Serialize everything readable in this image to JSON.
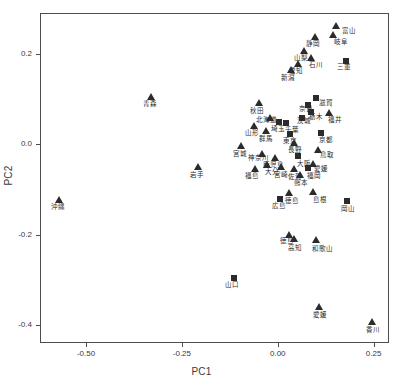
{
  "chart_data": {
    "type": "scatter",
    "title": "",
    "xlabel": "PC1",
    "ylabel": "PC2",
    "xlim": [
      -0.62,
      0.29
    ],
    "ylim": [
      -0.44,
      0.29
    ],
    "xticks": [
      -0.5,
      -0.25,
      0.0,
      0.25
    ],
    "xticklabels": [
      "-0.50",
      "-0.25",
      "0.00",
      "0.25"
    ],
    "yticks": [
      0.2,
      0.0,
      -0.2,
      -0.4
    ],
    "yticklabels": [
      "0.2",
      "0.0",
      "-0.2",
      "-0.4"
    ],
    "grid": false,
    "legend": "none",
    "marker_shapes": [
      "triangle",
      "square"
    ],
    "marker_color": "#2b2b2b",
    "points": [
      {
        "label": "富山",
        "x": 0.152,
        "y": 0.262,
        "marker": "triangle",
        "lx": 6,
        "ly": 2
      },
      {
        "label": "岐阜",
        "x": 0.143,
        "y": 0.242,
        "marker": "triangle",
        "lx": 1,
        "ly": 4
      },
      {
        "label": "静岡",
        "x": 0.096,
        "y": 0.237,
        "marker": "triangle",
        "lx": -9,
        "ly": 4
      },
      {
        "label": "山梨",
        "x": 0.069,
        "y": 0.205,
        "marker": "triangle",
        "lx": -10,
        "ly": 4
      },
      {
        "label": "石川",
        "x": 0.086,
        "y": 0.191,
        "marker": "triangle",
        "lx": -2,
        "ly": 4
      },
      {
        "label": "三重",
        "x": 0.178,
        "y": 0.184,
        "marker": "square",
        "lx": -9,
        "ly": 3
      },
      {
        "label": "愛知",
        "x": 0.054,
        "y": 0.178,
        "marker": "triangle",
        "lx": -9,
        "ly": 4
      },
      {
        "label": "新潟",
        "x": 0.035,
        "y": 0.163,
        "marker": "triangle",
        "lx": -10,
        "ly": 5
      },
      {
        "label": "青森",
        "x": -0.33,
        "y": 0.104,
        "marker": "triangle",
        "lx": -8,
        "ly": 4
      },
      {
        "label": "滋賀",
        "x": 0.1,
        "y": 0.103,
        "marker": "square",
        "lx": 3,
        "ly": 2
      },
      {
        "label": "秋田",
        "x": -0.048,
        "y": 0.09,
        "marker": "triangle",
        "lx": -9,
        "ly": 5
      },
      {
        "label": "奈良",
        "x": 0.079,
        "y": 0.086,
        "marker": "square",
        "lx": -9,
        "ly": 1
      },
      {
        "label": "栃木",
        "x": 0.087,
        "y": 0.07,
        "marker": "square",
        "lx": -2,
        "ly": 2
      },
      {
        "label": "福井",
        "x": 0.133,
        "y": 0.068,
        "marker": "triangle",
        "lx": -1,
        "ly": 4
      },
      {
        "label": "北海道",
        "x": -0.02,
        "y": 0.058,
        "marker": "triangle",
        "lx": -14,
        "ly": -1
      },
      {
        "label": "茨城",
        "x": 0.062,
        "y": 0.058,
        "marker": "square",
        "lx": -5,
        "ly": 0
      },
      {
        "label": "埼玉",
        "x": 0.003,
        "y": 0.048,
        "marker": "square",
        "lx": -8,
        "ly": 4
      },
      {
        "label": "千葉",
        "x": 0.022,
        "y": 0.046,
        "marker": "square",
        "lx": -1,
        "ly": 4
      },
      {
        "label": "山形",
        "x": -0.063,
        "y": 0.039,
        "marker": "triangle",
        "lx": -9,
        "ly": 4
      },
      {
        "label": "群馬",
        "x": -0.03,
        "y": 0.03,
        "marker": "triangle",
        "lx": -7,
        "ly": 5
      },
      {
        "label": "京都",
        "x": 0.113,
        "y": 0.024,
        "marker": "square",
        "lx": -2,
        "ly": 4
      },
      {
        "label": "東京",
        "x": 0.032,
        "y": 0.022,
        "marker": "square",
        "lx": -7,
        "ly": 4
      },
      {
        "label": "長野",
        "x": 0.041,
        "y": 0.003,
        "marker": "triangle",
        "lx": -6,
        "ly": 4
      },
      {
        "label": "宮城",
        "x": -0.097,
        "y": -0.005,
        "marker": "triangle",
        "lx": -8,
        "ly": 5
      },
      {
        "label": "鳥取",
        "x": 0.104,
        "y": -0.014,
        "marker": "triangle",
        "lx": 2,
        "ly": 2
      },
      {
        "label": "神奈川",
        "x": -0.041,
        "y": -0.022,
        "marker": "triangle",
        "lx": -14,
        "ly": 1
      },
      {
        "label": "鹿児島",
        "x": -0.008,
        "y": -0.031,
        "marker": "triangle",
        "lx": -12,
        "ly": 4
      },
      {
        "label": "大阪",
        "x": 0.053,
        "y": -0.027,
        "marker": "square",
        "lx": -1,
        "ly": 5
      },
      {
        "label": "大分",
        "x": -0.028,
        "y": -0.046,
        "marker": "triangle",
        "lx": -2,
        "ly": 4
      },
      {
        "label": "岩手",
        "x": -0.207,
        "y": -0.05,
        "marker": "triangle",
        "lx": -8,
        "ly": 5
      },
      {
        "label": "福島",
        "x": -0.059,
        "y": -0.055,
        "marker": "triangle",
        "lx": -10,
        "ly": 4
      },
      {
        "label": "宮崎",
        "x": 0.008,
        "y": -0.05,
        "marker": "triangle",
        "lx": -7,
        "ly": 5
      },
      {
        "label": "佐賀",
        "x": 0.042,
        "y": -0.055,
        "marker": "triangle",
        "lx": -6,
        "ly": 5
      },
      {
        "label": "福岡",
        "x": 0.08,
        "y": -0.053,
        "marker": "square",
        "lx": -1,
        "ly": 5
      },
      {
        "label": "愛媛",
        "x": 0.091,
        "y": -0.045,
        "marker": "triangle",
        "lx": 1,
        "ly": 2
      },
      {
        "label": "熊本",
        "x": 0.059,
        "y": -0.069,
        "marker": "triangle",
        "lx": -6,
        "ly": 5
      },
      {
        "label": "徳島",
        "x": 0.028,
        "y": -0.108,
        "marker": "triangle",
        "lx": -4,
        "ly": 5
      },
      {
        "label": "島根",
        "x": 0.092,
        "y": -0.105,
        "marker": "triangle",
        "lx": 0,
        "ly": 5
      },
      {
        "label": "広島",
        "x": 0.006,
        "y": -0.122,
        "marker": "square",
        "lx": -8,
        "ly": 4
      },
      {
        "label": "岡山",
        "x": 0.18,
        "y": -0.125,
        "marker": "square",
        "lx": -6,
        "ly": 5
      },
      {
        "label": "沖縄",
        "x": -0.57,
        "y": -0.123,
        "marker": "triangle",
        "lx": -8,
        "ly": 4
      },
      {
        "label": "徳島",
        "x": 0.03,
        "y": -0.202,
        "marker": "triangle",
        "lx": -9,
        "ly": 3
      },
      {
        "label": "高知",
        "x": 0.043,
        "y": -0.21,
        "marker": "triangle",
        "lx": -6,
        "ly": 6
      },
      {
        "label": "和歌山",
        "x": 0.1,
        "y": -0.213,
        "marker": "triangle",
        "lx": -4,
        "ly": 6
      },
      {
        "label": "山口",
        "x": -0.114,
        "y": -0.296,
        "marker": "square",
        "lx": -9,
        "ly": 4
      },
      {
        "label": "愛媛",
        "x": 0.107,
        "y": -0.36,
        "marker": "triangle",
        "lx": -6,
        "ly": 5
      },
      {
        "label": "香川",
        "x": 0.246,
        "y": -0.393,
        "marker": "triangle",
        "lx": -6,
        "ly": 5
      }
    ]
  }
}
